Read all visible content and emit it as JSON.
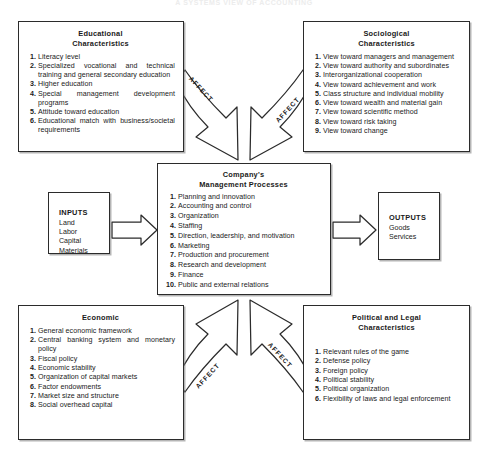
{
  "page": {
    "header_ghost": "A SYSTEMS VIEW OF ACCOUNTING"
  },
  "boxes": {
    "educational": {
      "title_line1": "Educational",
      "title_line2": "Characteristics",
      "items": [
        "Literacy level",
        "Specialized vocational and technical training and general secondary education",
        "Higher education",
        "Special management development programs",
        "Attitude toward education",
        "Educational match with business/societal requirements"
      ]
    },
    "sociological": {
      "title_line1": "Sociological",
      "title_line2": "Characteristics",
      "items": [
        "View toward managers and management",
        "View toward authority and subordinates",
        "Interorganizational cooperation",
        "View toward achievement and work",
        "Class structure and individual mobility",
        "View toward wealth and material gain",
        "View toward scientific method",
        "View toward risk taking",
        "View toward change"
      ]
    },
    "management": {
      "title_line1": "Company's",
      "title_line2": "Management Processes",
      "items": [
        "Planning and innovation",
        "Accounting and control",
        "Organization",
        "Staffing",
        "Direction, leadership, and motivation",
        "Marketing",
        "Production and procurement",
        "Research and development",
        "Finance",
        "Public and external relations"
      ]
    },
    "economic": {
      "title_line1": "Economic",
      "title_line2": "",
      "items": [
        "General economic framework",
        "Central banking system and monetary policy",
        "Fiscal policy",
        "Economic stability",
        "Organization of capital markets",
        "Factor endowments",
        "Market size and structure",
        "Social overhead capital"
      ]
    },
    "political": {
      "title_line1": "Political and Legal",
      "title_line2": "Characteristics",
      "items": [
        "Relevant rules of the game",
        "Defense policy",
        "Foreign policy",
        "Political stability",
        "Political organization",
        "Flexibility of laws and legal enforcement"
      ]
    },
    "inputs": {
      "title": "INPUTS",
      "lines": [
        "Land",
        "Labor",
        "Capital",
        "Materials"
      ]
    },
    "outputs": {
      "title": "OUTPUTS",
      "lines": [
        "Goods",
        "Services"
      ]
    }
  },
  "arrows": {
    "affect_top_left": "AFFECT",
    "affect_top_right": "AFFECT",
    "affect_bottom_left": "AFFECT",
    "affect_bottom_right": "AFFECT"
  },
  "colors": {
    "stroke": "#2b2b2b",
    "background": "#ffffff",
    "text": "#1a1a1a"
  }
}
